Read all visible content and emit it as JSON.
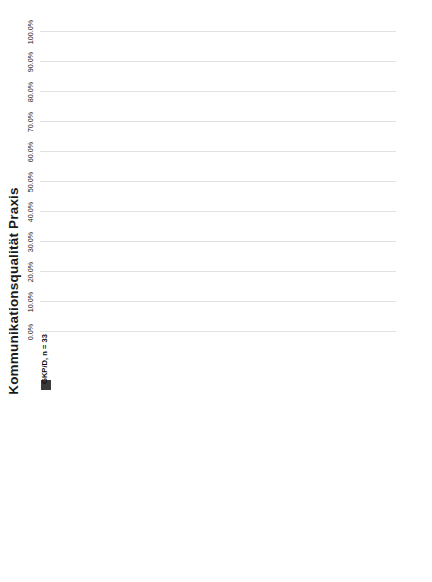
{
  "chart_data": {
    "type": "bar",
    "subtype": "stacked-horizontal-100pct",
    "title": "Kommunikationsqualität Praxis",
    "xlabel": "",
    "ylabel": "",
    "xlim": [
      0,
      100
    ],
    "xticks": [
      "0.0%",
      "10.0%",
      "20.0%",
      "30.0%",
      "40.0%",
      "50.0%",
      "60.0%",
      "70.0%",
      "80.0%",
      "90.0%",
      "100.0%"
    ],
    "xtick_values": [
      0,
      10,
      20,
      30,
      40,
      50,
      60,
      70,
      80,
      90,
      100
    ],
    "grid": true,
    "legend_position": "bottom",
    "legend": [
      "immer",
      "überwiegend",
      "teilweise",
      "selten",
      "nie",
      "kann ich nicht beurteilen"
    ],
    "colors": [
      "#3f3f3f",
      "#5a5a5a",
      "#8f8f8f",
      "#b4b4b4",
      "#d2d2d2",
      "#1c1c1c"
    ],
    "groups": [
      {
        "name": "GKP/D, n = 33",
        "marker": "solid",
        "categories": [
          "KO Praxis1: Ich konnte meine Ausbildungsverantwortliche (Berufsbildnerin, Mentorin, Praxisanleiterin od. ähnl.) jederzeit ansprechen",
          "KO Praxis2: Meine Arbeitskolleg/innen im Pflegeteam hatten \"ein offenes Ohr\" für mich",
          "KO Praxis3: Die Kommunikation auf der Station war partnerschaftlich",
          "KO Praxis4: Es gab Gelegenheiten, spontan miteinander ins Gespräch zu kommen",
          "KO Praxis5: Es gab für mich Gelegenheiten, auch mit anderen Berufsgruppen wie Ärztinnen oder Therapeut/innen ins Gespräch zu kommen"
        ],
        "series": [
          {
            "name": "immer",
            "values": [
              12.1,
              12.1,
              3.0,
              12.1,
              15.2
            ]
          },
          {
            "name": "überwiegend",
            "values": [
              51.5,
              45.5,
              36.4,
              24.2,
              24.2
            ]
          },
          {
            "name": "teilweise",
            "values": [
              24.2,
              30.3,
              54.5,
              53.6,
              51.5
            ]
          },
          {
            "name": "selten",
            "values": [
              12.1,
              12.1,
              6.1,
              10.1,
              9.1
            ]
          },
          {
            "name": "nie",
            "values": [
              0.0,
              0.0,
              0.0,
              0.0,
              0.0
            ]
          },
          {
            "name": "kann ich nicht beurteilen",
            "values": [
              0.0,
              0.0,
              0.0,
              0.0,
              0.0
            ]
          }
        ],
        "labels": [
          [
            "12.1%",
            "51.5%",
            "24.2%",
            "12.1%",
            "",
            ""
          ],
          [
            "12.1%",
            "45.5%",
            "30.3%",
            "12.1%",
            "",
            ""
          ],
          [
            "",
            "36.4%",
            "54.5%",
            "",
            "",
            ""
          ],
          [
            "12.1%",
            "24.2%",
            "53.6%",
            "",
            "",
            ""
          ],
          [
            "15.2%",
            "24.2%",
            "51.5%",
            "",
            "",
            ""
          ]
        ]
      },
      {
        "name": "GKP/A, n = 69",
        "marker": "bars",
        "categories": [
          "KO Praxis1: Ich konnte meine Ausbildungsverantwortliche (Berufsbildnerin, Mentorin, Praxisanleiterin od. ähnl.) jederzeit ansprechen",
          "KO Praxis2: Meine Arbeitskolleg/innen im Pflegeteam hatten \"ein offenes Ohr\" für mich",
          "KO Praxis3: Die Kommunikation auf der Station war partnerschaftlich",
          "KO Praxis4: Es gab Gelegenheiten, spontan miteinander ins Gespräch zu kommen",
          "KO Praxis5: Es gab für mich Gelegenheiten, auch mit anderen Berufsgruppen wie Ärztinnen oder Therapeut/innen ins Gespräch zu kommen"
        ],
        "series": [
          {
            "name": "immer",
            "values": [
              27.5,
              20.3,
              15.9,
              21.7,
              21.7
            ]
          },
          {
            "name": "überwiegend",
            "values": [
              47.8,
              53.6,
              42.0,
              50.7,
              37.7
            ]
          },
          {
            "name": "teilweise",
            "values": [
              15.9,
              18.8,
              38.1,
              23.2,
              33.3
            ]
          },
          {
            "name": "selten",
            "values": [
              5.8,
              5.8,
              4.0,
              2.9,
              5.8
            ]
          },
          {
            "name": "nie",
            "values": [
              1.5,
              1.5,
              0.0,
              1.5,
              1.5
            ]
          },
          {
            "name": "kann ich nicht beurteilen",
            "values": [
              1.5,
              0.0,
              0.0,
              0.0,
              0.0
            ]
          }
        ],
        "labels": [
          [
            "27.5%",
            "47.8%",
            "15.9%",
            "",
            "",
            ""
          ],
          [
            "20.3%",
            "53.6%",
            "18.8%",
            "",
            "",
            ""
          ],
          [
            "15.9%",
            "42.0%",
            "38.1%",
            "",
            "",
            ""
          ],
          [
            "21.7%",
            "50.7%",
            "23.2%",
            "",
            "",
            ""
          ],
          [
            "21.7%",
            "37.7%",
            "33.3%",
            "",
            "",
            ""
          ]
        ]
      },
      {
        "name": "HF/CH, n = 54",
        "marker": "cross",
        "categories": [
          "KO Praxis1: Ich konnte meine Ausbildungsverantwortliche (Berufsbildnerin, Mentorin, Praxisanleiterin od. ähnl.) jederzeit ansprechen",
          "KO Praxis2: Meine Arbeitskolleg/innen im Pflegeteam hatten \"ein offenes Ohr\" für mich",
          "KO Praxis3: Die Kommunikation auf der Station war partnerschaftlich",
          "KO Praxis4: Es gab Gelegenheiten, spontan miteinander ins Gespräch zu kommen",
          "KO Praxis5: Es gab für mich Gelegenheiten, auch mit anderen Berufsgruppen wie Ärztinnen oder Therapeut/innen ins Gespräch zu kommen"
        ],
        "series": [
          {
            "name": "immer",
            "values": [
              42.6,
              25.9,
              31.5,
              33.3,
              20.4
            ]
          },
          {
            "name": "überwiegend",
            "values": [
              33.3,
              51.9,
              48.1,
              40.7,
              42.6
            ]
          },
          {
            "name": "teilweise",
            "values": [
              16.7,
              16.7,
              16.7,
              20.4,
              24.1
            ]
          },
          {
            "name": "selten",
            "values": [
              3.7,
              3.7,
              1.9,
              1.9,
              7.4
            ]
          },
          {
            "name": "nie",
            "values": [
              1.9,
              0.0,
              0.0,
              1.9,
              1.9
            ]
          },
          {
            "name": "kann ich nicht beurteilen",
            "values": [
              1.8,
              1.8,
              1.8,
              1.8,
              3.6
            ]
          }
        ],
        "labels": [
          [
            "42.6%",
            "33.3%",
            "16.7%",
            "",
            "",
            ""
          ],
          [
            "25.9%",
            "51.9%",
            "16.7%",
            "",
            "",
            ""
          ],
          [
            "31.5%",
            "48.1%",
            "16.7%",
            "",
            "",
            ""
          ],
          [
            "33.3%",
            "40.7%",
            "20.4%",
            "",
            "",
            ""
          ],
          [
            "20.4%",
            "42.6%",
            "24.1%",
            "",
            "",
            ""
          ]
        ]
      }
    ]
  }
}
